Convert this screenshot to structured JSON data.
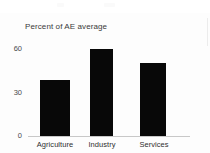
{
  "figure": {
    "background_color": "#fdfdfd",
    "title": "Percent of AE average",
    "right_divider": "panel-divider"
  },
  "chart_data": {
    "type": "bar",
    "title": "Percent of AE average",
    "subtitle": "",
    "xlabel": "",
    "ylabel": "",
    "categories": [
      "Agriculture",
      "Industry",
      "Services"
    ],
    "values": [
      38,
      59,
      50
    ],
    "series": [
      {
        "name": "Percent of AE average",
        "values": [
          38,
          59,
          50
        ],
        "color": "#080808"
      }
    ],
    "ylim": [
      0,
      66
    ],
    "yticks": [
      0,
      30,
      60
    ],
    "ytick_labels": [
      "0",
      "30",
      "60"
    ],
    "xtick_labels": [
      "Agriculture",
      "Industry",
      "Services"
    ],
    "grid": false,
    "legend": false,
    "legend_position": "none",
    "bar_color": "#080808",
    "axis_color": "#c8c8c8"
  },
  "axis": {
    "y_labels": [
      "60",
      "30",
      "0"
    ],
    "x_labels": [
      "Agriculture",
      "Industry",
      "Services"
    ]
  }
}
